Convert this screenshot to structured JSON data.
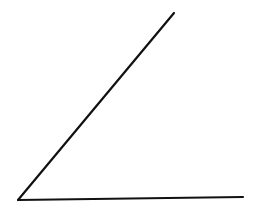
{
  "diagram": {
    "type": "angle",
    "stroke_color": "#111111",
    "stroke_width": 2.2,
    "background": "#ffffff",
    "vertex": {
      "x": 18,
      "y": 200
    },
    "rays": [
      {
        "name": "inclined-ray",
        "end": {
          "x": 174,
          "y": 13
        }
      },
      {
        "name": "horizontal-ray",
        "end": {
          "x": 243,
          "y": 197
        }
      }
    ]
  }
}
